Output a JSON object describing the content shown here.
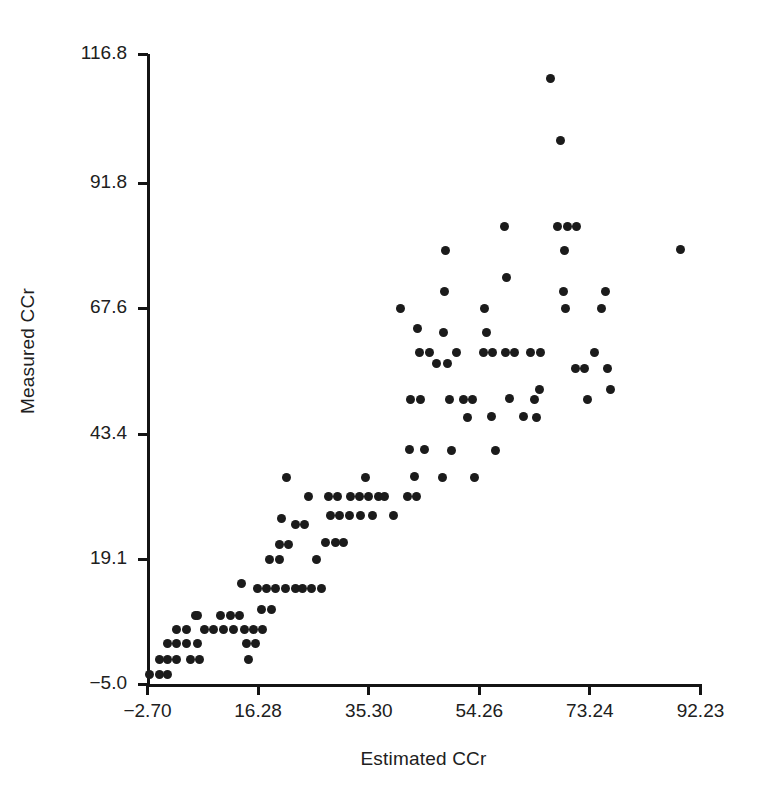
{
  "chart_data": {
    "type": "scatter",
    "title": "",
    "xlabel": "Estimated CCr",
    "ylabel": "Measured CCr",
    "xlim": [
      -2.7,
      92.23
    ],
    "ylim": [
      -5.0,
      116.8
    ],
    "grid": false,
    "legend": null,
    "xticks": [
      "-2.70",
      "16.28",
      "35.30",
      "54.26",
      "73.24",
      "92.23"
    ],
    "xtick_values": [
      -2.7,
      16.28,
      35.3,
      54.26,
      73.24,
      92.23
    ],
    "yticks": [
      "-5.0",
      "19.1",
      "43.4",
      "67.6",
      "91.8",
      "116.8"
    ],
    "ytick_values": [
      -5.0,
      19.1,
      43.4,
      67.6,
      91.8,
      116.8
    ],
    "marker": "filled-circle",
    "marker_color": "#1b1b1b",
    "n_points": 126,
    "points": [
      [
        -2.2,
        -3.1
      ],
      [
        -0.6,
        -3.1
      ],
      [
        0.9,
        -3.1
      ],
      [
        -0.6,
        -0.2
      ],
      [
        0.9,
        -0.2
      ],
      [
        2.4,
        -0.2
      ],
      [
        0.9,
        2.8
      ],
      [
        2.4,
        2.8
      ],
      [
        4.0,
        2.8
      ],
      [
        5.9,
        2.8
      ],
      [
        4.8,
        -0.2
      ],
      [
        6.3,
        -0.2
      ],
      [
        5.6,
        8.2
      ],
      [
        7.2,
        5.5
      ],
      [
        8.8,
        5.5
      ],
      [
        10.4,
        5.5
      ],
      [
        12.2,
        5.5
      ],
      [
        14.0,
        5.5
      ],
      [
        11.6,
        8.2
      ],
      [
        13.2,
        8.2
      ],
      [
        13.6,
        14.4
      ],
      [
        14.4,
        2.8
      ],
      [
        16.0,
        2.8
      ],
      [
        14.8,
        -0.2
      ],
      [
        16.2,
        13.5
      ],
      [
        17.8,
        13.5
      ],
      [
        19.4,
        13.5
      ],
      [
        21.0,
        13.5
      ],
      [
        22.8,
        13.5
      ],
      [
        17.0,
        9.5
      ],
      [
        18.6,
        9.5
      ],
      [
        18.4,
        19.1
      ],
      [
        20.0,
        19.1
      ],
      [
        20.0,
        22.0
      ],
      [
        21.6,
        22.0
      ],
      [
        20.4,
        27.0
      ],
      [
        21.2,
        35.0
      ],
      [
        22.8,
        25.8
      ],
      [
        24.4,
        25.8
      ],
      [
        25.0,
        31.2
      ],
      [
        25.6,
        13.5
      ],
      [
        27.2,
        13.5
      ],
      [
        28.4,
        31.2
      ],
      [
        30.0,
        31.2
      ],
      [
        28.8,
        27.5
      ],
      [
        30.4,
        27.5
      ],
      [
        28.0,
        22.3
      ],
      [
        29.6,
        22.3
      ],
      [
        32.2,
        31.2
      ],
      [
        33.8,
        31.2
      ],
      [
        35.4,
        31.2
      ],
      [
        37.0,
        31.2
      ],
      [
        32.0,
        27.5
      ],
      [
        34.0,
        27.5
      ],
      [
        36.0,
        27.5
      ],
      [
        34.8,
        35.0
      ],
      [
        39.6,
        27.5
      ],
      [
        40.8,
        67.6
      ],
      [
        42.0,
        31.2
      ],
      [
        43.6,
        31.2
      ],
      [
        42.4,
        40.4
      ],
      [
        43.2,
        35.2
      ],
      [
        42.6,
        50.0
      ],
      [
        44.2,
        50.0
      ],
      [
        43.8,
        63.8
      ],
      [
        44.0,
        59.0
      ],
      [
        45.8,
        59.0
      ],
      [
        47.0,
        57.0
      ],
      [
        48.0,
        35.0
      ],
      [
        48.6,
        78.8
      ],
      [
        48.4,
        70.8
      ],
      [
        48.2,
        63.0
      ],
      [
        48.8,
        57.0
      ],
      [
        49.2,
        50.0
      ],
      [
        49.6,
        40.2
      ],
      [
        51.6,
        50.0
      ],
      [
        53.2,
        50.0
      ],
      [
        52.4,
        46.5
      ],
      [
        53.6,
        35.0
      ],
      [
        55.2,
        67.6
      ],
      [
        55.6,
        63.0
      ],
      [
        55.0,
        59.0
      ],
      [
        56.6,
        59.0
      ],
      [
        56.4,
        46.8
      ],
      [
        57.2,
        40.2
      ],
      [
        58.6,
        83.4
      ],
      [
        59.0,
        73.6
      ],
      [
        58.8,
        59.0
      ],
      [
        60.4,
        59.0
      ],
      [
        59.6,
        50.2
      ],
      [
        63.2,
        59.0
      ],
      [
        64.8,
        59.0
      ],
      [
        63.8,
        50.0
      ],
      [
        64.2,
        46.5
      ],
      [
        64.6,
        52.0
      ],
      [
        66.6,
        112.0
      ],
      [
        68.2,
        100.0
      ],
      [
        67.8,
        83.4
      ],
      [
        69.4,
        83.4
      ],
      [
        71.0,
        83.4
      ],
      [
        69.0,
        78.8
      ],
      [
        68.8,
        70.8
      ],
      [
        69.2,
        67.6
      ],
      [
        70.8,
        56.0
      ],
      [
        72.4,
        56.0
      ],
      [
        74.2,
        59.0
      ],
      [
        76.0,
        70.8
      ],
      [
        75.4,
        67.6
      ],
      [
        76.4,
        56.0
      ],
      [
        76.8,
        52.0
      ],
      [
        88.8,
        79.0
      ],
      [
        2.4,
        5.5
      ],
      [
        4.0,
        5.5
      ],
      [
        6.0,
        8.2
      ],
      [
        10.0,
        8.2
      ],
      [
        15.6,
        5.5
      ],
      [
        17.2,
        5.5
      ],
      [
        24.0,
        13.5
      ],
      [
        26.4,
        19.1
      ],
      [
        31.0,
        22.3
      ],
      [
        38.0,
        31.2
      ],
      [
        45.0,
        40.4
      ],
      [
        50.4,
        59.0
      ],
      [
        62.0,
        46.8
      ],
      [
        73.0,
        50.0
      ]
    ]
  }
}
